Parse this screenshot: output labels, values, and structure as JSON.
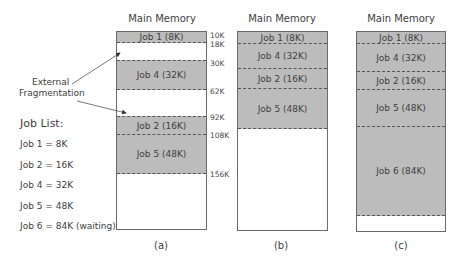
{
  "diagram": {
    "memory_title": "Main Memory",
    "annotation": [
      "External",
      "Fragmentation"
    ],
    "job_list": {
      "heading": "Job List:",
      "items": [
        "Job 1 = 8K",
        "Job 2 = 16K",
        "Job 4 = 32K",
        "Job 5 = 48K",
        "Job 6 = 84K (waiting)"
      ]
    },
    "panels": [
      {
        "caption": "(a)",
        "segments": [
          {
            "label": "Job 1 (8K)",
            "type": "job"
          },
          {
            "label": "",
            "type": "free"
          },
          {
            "label": "Job 4 (32K)",
            "type": "job"
          },
          {
            "label": "",
            "type": "free"
          },
          {
            "label": "Job 2 (16K)",
            "type": "job"
          },
          {
            "label": "Job 5 (48K)",
            "type": "job"
          },
          {
            "label": "",
            "type": "free"
          }
        ],
        "addresses": [
          "10K",
          "18K",
          "30K",
          "62K",
          "92K",
          "108K",
          "156K"
        ]
      },
      {
        "caption": "(b)",
        "segments": [
          {
            "label": "Job 1 (8K)",
            "type": "job"
          },
          {
            "label": "Job 4 (32K)",
            "type": "job"
          },
          {
            "label": "Job 2 (16K)",
            "type": "job"
          },
          {
            "label": "Job 5 (48K)",
            "type": "job"
          },
          {
            "label": "",
            "type": "free"
          }
        ]
      },
      {
        "caption": "(c)",
        "segments": [
          {
            "label": "Job 1 (8K)",
            "type": "job"
          },
          {
            "label": "Job 4 (32K)",
            "type": "job"
          },
          {
            "label": "Job 2 (16K)",
            "type": "job"
          },
          {
            "label": "Job 5 (48K)",
            "type": "job"
          },
          {
            "label": "Job 6 (84K)",
            "type": "job"
          },
          {
            "label": "",
            "type": "free"
          }
        ]
      }
    ],
    "colors": {
      "job_fill": "#bcbcbc",
      "free_fill": "#ffffff",
      "border": "#6a6a6a",
      "text": "#3e3e3e"
    }
  }
}
